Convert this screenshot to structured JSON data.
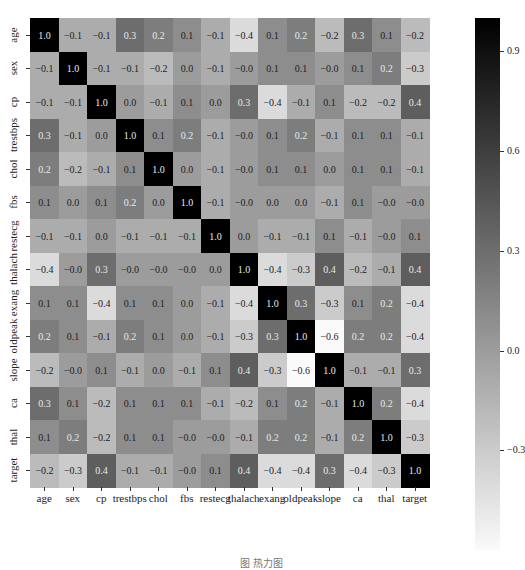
{
  "chart_data": {
    "type": "heatmap",
    "title": "",
    "variables": [
      "age",
      "sex",
      "cp",
      "trestbps",
      "chol",
      "fbs",
      "restecg",
      "thalach",
      "exang",
      "oldpeak",
      "slope",
      "ca",
      "thal",
      "target"
    ],
    "matrix": [
      [
        "1.0",
        "-0.1",
        "-0.1",
        "0.3",
        "0.2",
        "0.1",
        "-0.1",
        "-0.4",
        "0.1",
        "0.2",
        "-0.2",
        "0.3",
        "0.1",
        "-0.2"
      ],
      [
        "-0.1",
        "1.0",
        "-0.1",
        "-0.1",
        "-0.2",
        "0.0",
        "-0.1",
        "-0.0",
        "0.1",
        "0.1",
        "-0.0",
        "0.1",
        "0.2",
        "-0.3"
      ],
      [
        "-0.1",
        "-0.1",
        "1.0",
        "0.0",
        "-0.1",
        "0.1",
        "0.0",
        "0.3",
        "-0.4",
        "-0.1",
        "0.1",
        "-0.2",
        "-0.2",
        "0.4"
      ],
      [
        "0.3",
        "-0.1",
        "0.0",
        "1.0",
        "0.1",
        "0.2",
        "-0.1",
        "-0.0",
        "0.1",
        "0.2",
        "-0.1",
        "0.1",
        "0.1",
        "-0.1"
      ],
      [
        "0.2",
        "-0.2",
        "-0.1",
        "0.1",
        "1.0",
        "0.0",
        "-0.1",
        "-0.0",
        "0.1",
        "0.1",
        "0.0",
        "0.1",
        "0.1",
        "-0.1"
      ],
      [
        "0.1",
        "0.0",
        "0.1",
        "0.2",
        "0.0",
        "1.0",
        "-0.1",
        "-0.0",
        "0.0",
        "0.0",
        "-0.1",
        "0.1",
        "-0.0",
        "-0.0"
      ],
      [
        "-0.1",
        "-0.1",
        "0.0",
        "-0.1",
        "-0.1",
        "-0.1",
        "1.0",
        "0.0",
        "-0.1",
        "-0.1",
        "0.1",
        "-0.1",
        "-0.0",
        "0.1"
      ],
      [
        "-0.4",
        "-0.0",
        "0.3",
        "-0.0",
        "-0.0",
        "-0.0",
        "0.0",
        "1.0",
        "-0.4",
        "-0.3",
        "0.4",
        "-0.2",
        "-0.1",
        "0.4"
      ],
      [
        "0.1",
        "0.1",
        "-0.4",
        "0.1",
        "0.1",
        "0.0",
        "-0.1",
        "-0.4",
        "1.0",
        "0.3",
        "-0.3",
        "0.1",
        "0.2",
        "-0.4"
      ],
      [
        "0.2",
        "0.1",
        "-0.1",
        "0.2",
        "0.1",
        "0.0",
        "-0.1",
        "-0.3",
        "0.3",
        "1.0",
        "-0.6",
        "0.2",
        "0.2",
        "-0.4"
      ],
      [
        "-0.2",
        "-0.0",
        "0.1",
        "-0.1",
        "0.0",
        "-0.1",
        "0.1",
        "0.4",
        "-0.3",
        "-0.6",
        "1.0",
        "-0.1",
        "-0.1",
        "0.3"
      ],
      [
        "0.3",
        "0.1",
        "-0.2",
        "0.1",
        "0.1",
        "0.1",
        "-0.1",
        "-0.2",
        "0.1",
        "0.2",
        "-0.1",
        "1.0",
        "0.2",
        "-0.4"
      ],
      [
        "0.1",
        "0.2",
        "-0.2",
        "0.1",
        "0.1",
        "-0.0",
        "-0.0",
        "-0.1",
        "0.2",
        "0.2",
        "-0.1",
        "0.2",
        "1.0",
        "-0.3"
      ],
      [
        "-0.2",
        "-0.3",
        "0.4",
        "-0.1",
        "-0.1",
        "-0.0",
        "0.1",
        "0.4",
        "-0.4",
        "-0.4",
        "0.3",
        "-0.4",
        "-0.3",
        "1.0"
      ]
    ],
    "colorbar": {
      "ticks": [
        "0.9",
        "0.6",
        "0.3",
        "0.0",
        "-0.3"
      ],
      "tick_values": [
        0.9,
        0.6,
        0.3,
        0.0,
        -0.3
      ],
      "range": [
        -0.6,
        1.0
      ],
      "colormap": "grayscale (white = low, black = high)"
    },
    "annotations": "cell values shown with 1 decimal",
    "grid": false,
    "legend_position": "right (colorbar)"
  },
  "caption": "图 热力图"
}
